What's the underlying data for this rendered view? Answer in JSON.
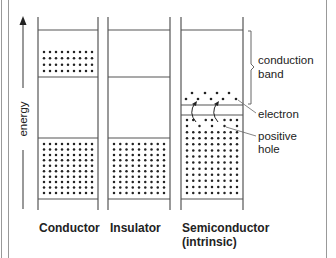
{
  "diagram": {
    "axis": {
      "label": "energy",
      "direction": "up"
    },
    "columns": [
      {
        "id": "conductor",
        "caption_line1": "Conductor",
        "caption_line2": ""
      },
      {
        "id": "insulator",
        "caption_line1": "Insulator",
        "caption_line2": ""
      },
      {
        "id": "semiconductor",
        "caption_line1": "Semiconductor",
        "caption_line2": "(intrinsic)"
      }
    ],
    "annotations": {
      "conduction_band_line1": "conduction",
      "conduction_band_line2": "band",
      "electron": "electron",
      "positive_hole_line1": "positive",
      "positive_hole_line2": "hole"
    },
    "colors": {
      "line": "#555555",
      "dot": "#222222",
      "text": "#222222",
      "border": "#888888"
    }
  }
}
